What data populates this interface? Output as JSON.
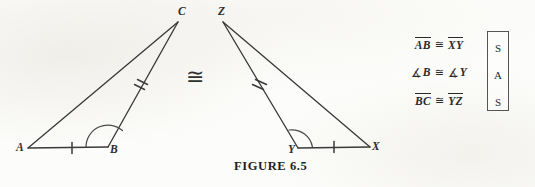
{
  "figure": {
    "caption": "FIGURE  6.5",
    "congruence_symbol": "≅",
    "background_color": "#fcfcfa",
    "ink_color": "#3a3a3a"
  },
  "left_triangle": {
    "name": "triangle-ABC",
    "vertices": [
      {
        "label": "A",
        "x": 28,
        "y": 148
      },
      {
        "label": "B",
        "x": 108,
        "y": 147
      },
      {
        "label": "C",
        "x": 178,
        "y": 22
      }
    ],
    "labels": {
      "a": "A",
      "b": "B",
      "c": "C"
    },
    "marks": {
      "single_tick_side": "AB",
      "double_tick_side": "BC",
      "angle_arc_vertex": "B"
    }
  },
  "right_triangle": {
    "name": "triangle-XYZ",
    "vertices": [
      {
        "label": "Z",
        "x": 223,
        "y": 22
      },
      {
        "label": "Y",
        "x": 298,
        "y": 148
      },
      {
        "label": "X",
        "x": 370,
        "y": 147
      }
    ],
    "labels": {
      "x": "X",
      "y": "Y",
      "z": "Z"
    },
    "marks": {
      "single_tick_side": "YX",
      "double_tick_side": "YZ",
      "angle_arc_vertex": "Y"
    }
  },
  "statements": [
    {
      "left_term": "AB",
      "left_notation": "segment",
      "relation": "≅",
      "right_term": "XY",
      "right_notation": "segment",
      "code": "S"
    },
    {
      "left_term": "B",
      "left_notation": "angle",
      "relation": "≅",
      "right_term": "Y",
      "right_notation": "angle",
      "code": "A"
    },
    {
      "left_term": "BC",
      "left_notation": "segment",
      "relation": "≅",
      "right_term": "YZ",
      "right_notation": "segment",
      "code": "S"
    }
  ],
  "sas_box": {
    "letters": [
      "S",
      "A",
      "S"
    ]
  },
  "symbols": {
    "angle": "∡"
  }
}
